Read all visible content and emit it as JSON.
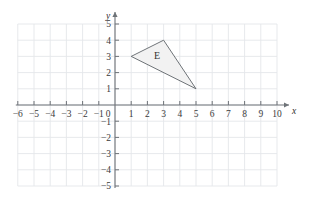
{
  "figure": {
    "kind": "cartesian-coordinate-grid",
    "background_color": "#ffffff",
    "grid_color": "#eef0f2",
    "grid_major_color": "#e4e7ea",
    "axis_color": "#6e7378",
    "tick_color": "#6e7378",
    "label_color": "#3a3a3a"
  },
  "axes": {
    "x": {
      "name": "x",
      "min": -6,
      "max": 10,
      "step": 1,
      "tick_labels": [
        "-6",
        "-5",
        "-4",
        "-3",
        "-2",
        "-1",
        "0",
        "1",
        "2",
        "3",
        "4",
        "5",
        "6",
        "7",
        "8",
        "9",
        "10"
      ],
      "arrow": true
    },
    "y": {
      "name": "y",
      "min": -5,
      "max": 5,
      "step": 1,
      "tick_labels": [
        "-5",
        "-4",
        "-3",
        "-2",
        "-1",
        "1",
        "2",
        "3",
        "4",
        "5"
      ],
      "arrow": true
    },
    "origin_label": "0"
  },
  "shapes": [
    {
      "label": "E",
      "type": "triangle",
      "vertices": [
        [
          1,
          3
        ],
        [
          3,
          4
        ],
        [
          5,
          1
        ]
      ],
      "fill_color": "#f2f2f2",
      "stroke_color": "#5f6469",
      "label_position": [
        2.6,
        2.85
      ]
    }
  ]
}
